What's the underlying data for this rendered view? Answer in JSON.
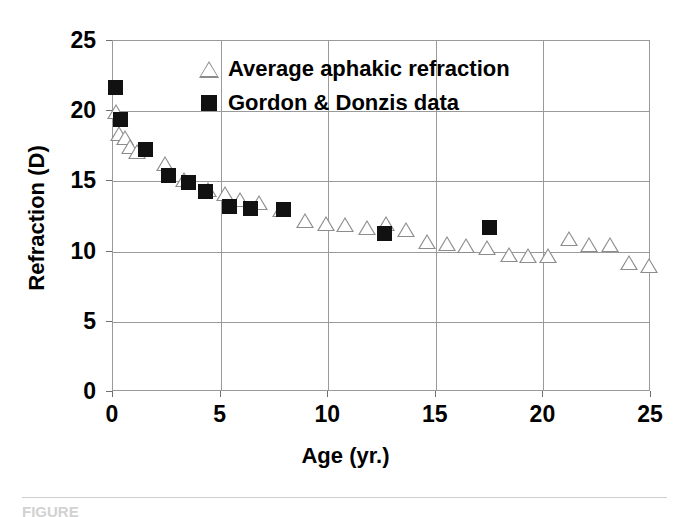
{
  "chart_data": {
    "type": "scatter",
    "title": "",
    "xlabel": "Age (yr.)",
    "ylabel": "Refraction (D)",
    "xlim": [
      0,
      25
    ],
    "ylim": [
      0,
      25
    ],
    "xticks": [
      "0",
      "5",
      "10",
      "15",
      "20",
      "25"
    ],
    "yticks": [
      "0",
      "5",
      "10",
      "15",
      "20",
      "25"
    ],
    "grid": true,
    "legend_position": "upper-center",
    "series": [
      {
        "name": "Average aphakic refraction",
        "marker": "open-triangle",
        "color": "#8c8c8c",
        "points": [
          {
            "x": 0.15,
            "y": 19.9
          },
          {
            "x": 0.3,
            "y": 18.3
          },
          {
            "x": 0.55,
            "y": 18.0
          },
          {
            "x": 0.8,
            "y": 17.4
          },
          {
            "x": 1.1,
            "y": 17.0
          },
          {
            "x": 2.4,
            "y": 16.2
          },
          {
            "x": 3.3,
            "y": 15.0
          },
          {
            "x": 4.4,
            "y": 14.3
          },
          {
            "x": 5.2,
            "y": 14.0
          },
          {
            "x": 5.9,
            "y": 13.6
          },
          {
            "x": 6.8,
            "y": 13.4
          },
          {
            "x": 7.8,
            "y": 12.9
          },
          {
            "x": 8.9,
            "y": 12.1
          },
          {
            "x": 9.9,
            "y": 11.9
          },
          {
            "x": 10.8,
            "y": 11.8
          },
          {
            "x": 11.8,
            "y": 11.6
          },
          {
            "x": 12.7,
            "y": 11.9
          },
          {
            "x": 13.6,
            "y": 11.5
          },
          {
            "x": 14.6,
            "y": 10.6
          },
          {
            "x": 15.5,
            "y": 10.5
          },
          {
            "x": 16.4,
            "y": 10.3
          },
          {
            "x": 17.4,
            "y": 10.2
          },
          {
            "x": 18.4,
            "y": 9.7
          },
          {
            "x": 19.3,
            "y": 9.6
          },
          {
            "x": 20.2,
            "y": 9.6
          },
          {
            "x": 21.2,
            "y": 10.8
          },
          {
            "x": 22.1,
            "y": 10.4
          },
          {
            "x": 23.1,
            "y": 10.4
          },
          {
            "x": 24.0,
            "y": 9.1
          },
          {
            "x": 24.9,
            "y": 8.9
          }
        ]
      },
      {
        "name": "Gordon & Donzis data",
        "marker": "filled-square",
        "color": "#111111",
        "points": [
          {
            "x": 0.1,
            "y": 21.7
          },
          {
            "x": 0.35,
            "y": 19.4
          },
          {
            "x": 1.5,
            "y": 17.3
          },
          {
            "x": 2.6,
            "y": 15.4
          },
          {
            "x": 3.5,
            "y": 14.9
          },
          {
            "x": 4.3,
            "y": 14.3
          },
          {
            "x": 5.4,
            "y": 13.2
          },
          {
            "x": 6.4,
            "y": 13.1
          },
          {
            "x": 7.9,
            "y": 13.0
          },
          {
            "x": 12.6,
            "y": 11.3
          },
          {
            "x": 17.5,
            "y": 11.7
          }
        ]
      }
    ]
  },
  "legend": {
    "entries": [
      {
        "label": "Average aphakic refraction",
        "marker": "open-triangle"
      },
      {
        "label": "Gordon & Donzis data",
        "marker": "filled-square"
      }
    ]
  },
  "caption": {
    "text": "FIGURE"
  }
}
